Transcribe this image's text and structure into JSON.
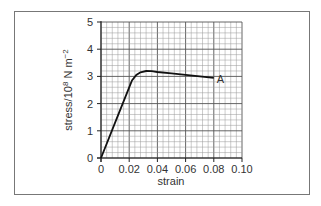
{
  "chart_data": {
    "type": "line",
    "title": "",
    "xlabel": "strain",
    "ylabel": "stress/10^8 N m^-2",
    "ylabel_parts": {
      "main": "stress/10",
      "sup": "8",
      "unit": " N m",
      "unit_sup": "−2"
    },
    "xlim": [
      0,
      0.1
    ],
    "ylim": [
      0,
      5
    ],
    "x_ticks": [
      "0",
      "0.02",
      "0.04",
      "0.06",
      "0.08",
      "0.10"
    ],
    "y_ticks": [
      "0",
      "1",
      "2",
      "3",
      "4",
      "5"
    ],
    "grid": true,
    "minor_divisions": 5,
    "series": [
      {
        "name": "stress-strain",
        "x": [
          0,
          0.01,
          0.02,
          0.022,
          0.025,
          0.028,
          0.032,
          0.036,
          0.04,
          0.05,
          0.06,
          0.07,
          0.08
        ],
        "y": [
          0,
          1.3,
          2.6,
          2.85,
          3.05,
          3.15,
          3.2,
          3.19,
          3.16,
          3.11,
          3.06,
          3.0,
          2.95
        ]
      }
    ],
    "annotations": [
      {
        "text": "A",
        "x": 0.08,
        "y": 2.95
      }
    ]
  }
}
